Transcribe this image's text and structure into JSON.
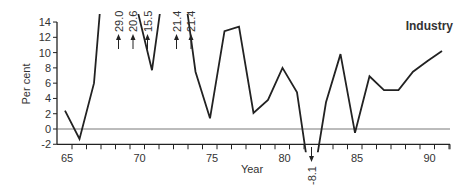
{
  "chart_data": {
    "type": "line",
    "title": "Industry",
    "xlabel": "Year",
    "ylabel": "Per cent",
    "xlim": [
      65,
      91
    ],
    "ylim": [
      -2,
      14
    ],
    "yticks": [
      -2,
      0,
      2,
      4,
      6,
      8,
      10,
      12,
      14
    ],
    "xtick_labels": [
      "65",
      "70",
      "75",
      "80",
      "85",
      "90"
    ],
    "grid": false,
    "legend": null,
    "x": [
      65,
      66,
      67,
      68,
      69,
      70,
      71,
      72,
      73,
      74,
      75,
      76,
      77,
      78,
      79,
      80,
      81,
      82,
      83,
      84,
      85,
      86,
      87,
      88,
      89,
      90,
      91
    ],
    "values": [
      2.4,
      -1.3,
      6.0,
      29.0,
      20.6,
      15.5,
      7.7,
      21.4,
      21.4,
      7.5,
      1.4,
      12.8,
      13.4,
      2.1,
      3.8,
      8.0,
      4.8,
      -8.1,
      3.5,
      9.8,
      -0.5,
      6.9,
      5.1,
      5.1,
      7.5,
      8.9,
      10.2
    ],
    "annotations": [
      {
        "x": 68,
        "text": "29.0",
        "direction": "up"
      },
      {
        "x": 69,
        "text": "20.6",
        "direction": "up"
      },
      {
        "x": 70,
        "text": "15.5",
        "direction": "up"
      },
      {
        "x": 72,
        "text": "21.4",
        "direction": "up"
      },
      {
        "x": 73,
        "text": "21.4",
        "direction": "up"
      },
      {
        "x": 82,
        "text": "-8.1",
        "direction": "down"
      }
    ]
  }
}
